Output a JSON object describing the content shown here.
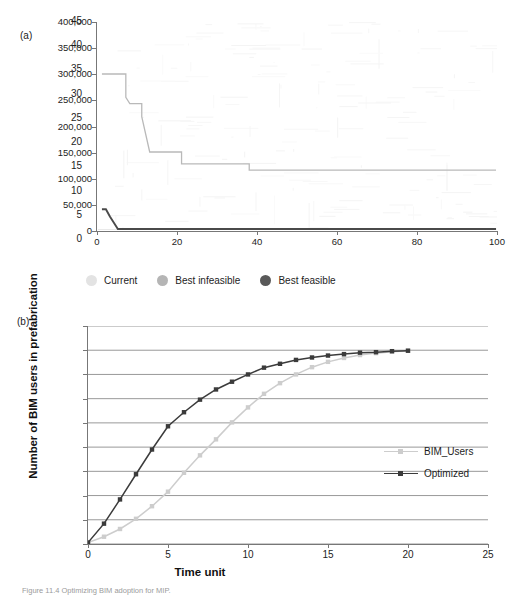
{
  "figure": {
    "panel_a_label": "(a)",
    "panel_b_label": "(b)",
    "caption": "Figure 11.4  Optimizing BIM adoption for MIP."
  },
  "chart_data": [
    {
      "type": "line",
      "id": "panel-a",
      "title": "",
      "xlabel": "",
      "ylabel": "",
      "xlim": [
        0,
        100
      ],
      "ylim": [
        0,
        400000
      ],
      "grid": false,
      "legend_position": "bottom",
      "xticks": [
        0,
        20,
        40,
        60,
        80,
        100
      ],
      "xtick_labels": [
        "0",
        "20",
        "40",
        "60",
        "80",
        "100"
      ],
      "yticks": [
        0,
        50000,
        100000,
        150000,
        200000,
        250000,
        300000,
        350000,
        400000
      ],
      "ytick_labels": [
        "0",
        "50,000",
        "100,000",
        "150,000",
        "200,000",
        "250,000",
        "300,000",
        "350,000",
        "400,000"
      ],
      "series": [
        {
          "name": "Current",
          "color": "#e2e2e2",
          "marker": "circle",
          "note": "noisy scatter trace, near-invisible light grey in scan",
          "x": [
            0,
            100
          ],
          "values": [
            0,
            0
          ]
        },
        {
          "name": "Best infeasible",
          "color": "#b9b9b9",
          "marker": "circle",
          "step": true,
          "x": [
            1,
            7,
            7,
            8,
            11,
            11,
            13,
            13,
            21,
            21,
            38,
            38,
            100
          ],
          "values": [
            300000,
            300000,
            255000,
            243000,
            243000,
            218000,
            150000,
            150000,
            150000,
            127000,
            127000,
            115000,
            115000
          ]
        },
        {
          "name": "Best feasible",
          "color": "#4a4a4a",
          "marker": "circle",
          "step": true,
          "x": [
            1,
            2,
            3,
            3,
            4,
            5,
            100
          ],
          "values": [
            40000,
            40000,
            26000,
            26000,
            14000,
            2000,
            2000
          ]
        }
      ]
    },
    {
      "type": "line",
      "id": "panel-b",
      "title": "",
      "xlabel": "Time unit",
      "ylabel": "Number of BIM users in prefabrication",
      "xlim": [
        0,
        25
      ],
      "ylim": [
        0,
        45
      ],
      "grid": true,
      "legend_position": "inside-right",
      "xticks": [
        0,
        5,
        10,
        15,
        20,
        25
      ],
      "xtick_labels": [
        "0",
        "5",
        "10",
        "15",
        "20",
        "25"
      ],
      "yticks": [
        0,
        5,
        10,
        15,
        20,
        25,
        30,
        35,
        40,
        45
      ],
      "ytick_labels": [
        "0",
        "5",
        "10",
        "15",
        "20",
        "25",
        "30",
        "35",
        "40",
        "45"
      ],
      "x": [
        0,
        1,
        2,
        3,
        4,
        5,
        6,
        7,
        8,
        9,
        10,
        11,
        12,
        13,
        14,
        15,
        16,
        17,
        18,
        19,
        20
      ],
      "series": [
        {
          "name": "BIM_Users",
          "color": "#cdcdcd",
          "marker": "square",
          "values": [
            0.3,
            1.5,
            3.1,
            5.2,
            7.8,
            10.8,
            14.7,
            18.3,
            21.6,
            25.1,
            28.2,
            31.0,
            33.2,
            35.0,
            36.5,
            37.6,
            38.4,
            39.0,
            39.4,
            39.7,
            39.9
          ]
        },
        {
          "name": "Optimized",
          "color": "#3b3b3b",
          "marker": "square",
          "values": [
            0.3,
            4.2,
            9.2,
            14.4,
            19.5,
            24.3,
            27.2,
            29.8,
            31.9,
            33.5,
            35.0,
            36.4,
            37.2,
            38.0,
            38.5,
            38.9,
            39.2,
            39.5,
            39.6,
            39.8,
            39.9
          ]
        }
      ]
    }
  ],
  "legend_a": {
    "items": [
      {
        "label": "Current",
        "color": "#e3e3e3"
      },
      {
        "label": "Best infeasible",
        "color": "#b5b5b5"
      },
      {
        "label": "Best feasible",
        "color": "#595959"
      }
    ]
  },
  "legend_b": {
    "items": [
      {
        "label": "BIM_Users",
        "color": "#cdcdcd"
      },
      {
        "label": "Optimized",
        "color": "#3b3b3b"
      }
    ]
  }
}
